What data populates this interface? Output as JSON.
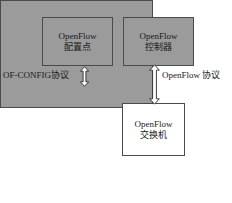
{
  "diagram": {
    "colors": {
      "box_fill": "#9b9b9b",
      "box_border": "#4a4a4a",
      "switch_fill": "#ffffff",
      "text": "#1a1a1a",
      "background": "#ffffff"
    },
    "nodes": {
      "config_point": {
        "line1": "OpenFlow",
        "line2": "配置点"
      },
      "controller": {
        "line1": "OpenFlow",
        "line2": "控制器"
      },
      "switch": {
        "line1": "OpenFlow",
        "line2": "交换机"
      },
      "device": {
        "label": ""
      }
    },
    "connections": [
      {
        "name": "of-config-link",
        "label": "OF-CONFIG协议",
        "arrow": "double-headed-vertical",
        "from": "config_point",
        "to": "device"
      },
      {
        "name": "openflow-link",
        "label": "OpenFlow 协议",
        "arrow": "double-headed-vertical",
        "from": "controller",
        "to": "switch"
      }
    ]
  }
}
